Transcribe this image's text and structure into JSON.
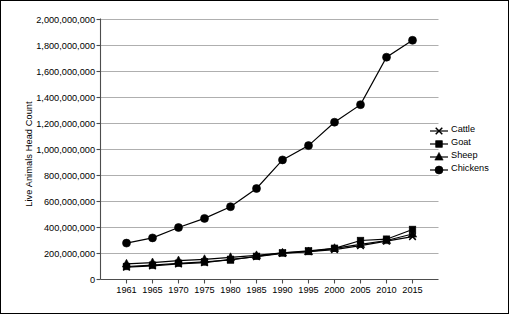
{
  "chart_data": {
    "type": "line",
    "title": "",
    "xlabel": "",
    "ylabel": "Live Animals Head Count",
    "categories": [
      "1961",
      "1965",
      "1970",
      "1975",
      "1980",
      "1985",
      "1990",
      "1995",
      "2000",
      "2005",
      "2010",
      "2015"
    ],
    "ylim": [
      0,
      2000000000
    ],
    "ytick_values": [
      0,
      200000000,
      400000000,
      600000000,
      800000000,
      1000000000,
      1200000000,
      1400000000,
      1600000000,
      1800000000,
      2000000000
    ],
    "ytick_labels": [
      "0",
      "200,000,000",
      "400,000,000",
      "600,000,000",
      "800,000,000",
      "1,000,000,000",
      "1,200,000,000",
      "1,400,000,000",
      "1,600,000,000",
      "1,800,000,000",
      "2,000,000,000"
    ],
    "grid": "horizontal",
    "legend_position": "right",
    "series": [
      {
        "name": "Cattle",
        "marker": "x",
        "color": "#000000",
        "values": [
          95000000,
          105000000,
          120000000,
          130000000,
          155000000,
          175000000,
          200000000,
          215000000,
          230000000,
          260000000,
          295000000,
          330000000
        ]
      },
      {
        "name": "Goat",
        "marker": "square",
        "color": "#000000",
        "values": [
          100000000,
          110000000,
          125000000,
          135000000,
          150000000,
          178000000,
          205000000,
          220000000,
          240000000,
          300000000,
          310000000,
          385000000
        ]
      },
      {
        "name": "Sheep",
        "marker": "triangle",
        "color": "#000000",
        "values": [
          120000000,
          130000000,
          145000000,
          155000000,
          170000000,
          185000000,
          205000000,
          215000000,
          240000000,
          270000000,
          300000000,
          350000000
        ]
      },
      {
        "name": "Chickens",
        "marker": "circle",
        "color": "#000000",
        "values": [
          280000000,
          320000000,
          400000000,
          470000000,
          560000000,
          700000000,
          920000000,
          1030000000,
          1210000000,
          1345000000,
          1710000000,
          1840000000
        ]
      }
    ]
  },
  "legend": {
    "items": [
      {
        "label": "Cattle"
      },
      {
        "label": "Goat"
      },
      {
        "label": "Sheep"
      },
      {
        "label": "Chickens"
      }
    ]
  }
}
